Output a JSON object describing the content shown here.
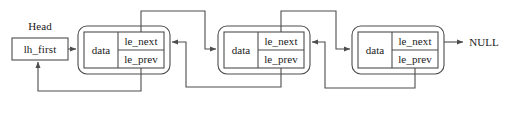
{
  "diagram": {
    "type": "doubly-linked-list",
    "stroke_color": "#4d4d4d",
    "text_color": "#1a1a1a",
    "background_color": "#ffffff",
    "head": {
      "caption": "Head",
      "field": "lh_first"
    },
    "terminator": "NULL",
    "node_fields": {
      "data": "data",
      "next": "le_next",
      "prev": "le_prev"
    },
    "nodes": [
      {
        "index": 1,
        "data": "data",
        "next": "le_next",
        "prev": "le_prev"
      },
      {
        "index": 2,
        "data": "data",
        "next": "le_next",
        "prev": "le_prev"
      },
      {
        "index": 3,
        "data": "data",
        "next": "le_next",
        "prev": "le_prev"
      }
    ]
  }
}
